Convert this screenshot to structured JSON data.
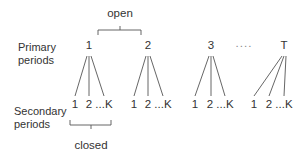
{
  "diagram": {
    "row_labels": {
      "primary": [
        "Primary",
        "periods"
      ],
      "secondary": [
        "Secondary",
        "periods"
      ]
    },
    "top_brace_label": "open",
    "bottom_brace_label": "closed",
    "primary_periods": [
      {
        "label": "1",
        "x": 89
      },
      {
        "label": "2",
        "x": 148
      },
      {
        "label": "3",
        "x": 211
      },
      {
        "label": "T",
        "x": 284
      }
    ],
    "ellipsis": "....",
    "secondary_labels": [
      "1",
      "2",
      "...K"
    ],
    "line_color": "#555555",
    "text_color": "#333333"
  }
}
